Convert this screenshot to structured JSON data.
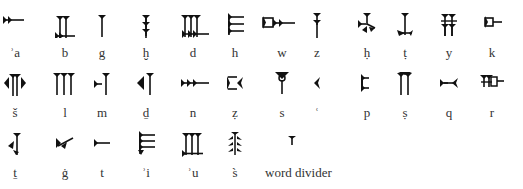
{
  "rows": [
    {
      "signs": [
        {
          "translit": "ʾa",
          "icon": "cuneiform-a-icon"
        },
        {
          "translit": "b",
          "icon": "cuneiform-b-icon"
        },
        {
          "translit": "g",
          "icon": "cuneiform-g-icon"
        },
        {
          "translit": "ḫ",
          "icon": "cuneiform-kh-icon"
        },
        {
          "translit": "d",
          "icon": "cuneiform-d-icon"
        },
        {
          "translit": "h",
          "icon": "cuneiform-h-icon"
        },
        {
          "translit": "w",
          "icon": "cuneiform-w-icon"
        },
        {
          "translit": "z",
          "icon": "cuneiform-z-icon"
        },
        {
          "translit": "ḥ",
          "icon": "cuneiform-hh-icon"
        },
        {
          "translit": "ṭ",
          "icon": "cuneiform-tt-icon"
        },
        {
          "translit": "y",
          "icon": "cuneiform-y-icon"
        },
        {
          "translit": "k",
          "icon": "cuneiform-k-icon"
        }
      ]
    },
    {
      "signs": [
        {
          "translit": "š",
          "icon": "cuneiform-sh-icon"
        },
        {
          "translit": "l",
          "icon": "cuneiform-l-icon"
        },
        {
          "translit": "m",
          "icon": "cuneiform-m-icon"
        },
        {
          "translit": "ḏ",
          "icon": "cuneiform-dh-icon"
        },
        {
          "translit": "n",
          "icon": "cuneiform-n-icon"
        },
        {
          "translit": "ẓ",
          "icon": "cuneiform-zz-icon"
        },
        {
          "translit": "s",
          "icon": "cuneiform-s-icon"
        },
        {
          "translit": "ʿ",
          "icon": "cuneiform-ayin-icon"
        },
        {
          "translit": "p",
          "icon": "cuneiform-p-icon"
        },
        {
          "translit": "ṣ",
          "icon": "cuneiform-ss-icon"
        },
        {
          "translit": "q",
          "icon": "cuneiform-q-icon"
        },
        {
          "translit": "r",
          "icon": "cuneiform-r-icon"
        }
      ]
    },
    {
      "signs": [
        {
          "translit": "ṯ",
          "icon": "cuneiform-th-icon"
        },
        {
          "translit": "ġ",
          "icon": "cuneiform-gh-icon"
        },
        {
          "translit": "t",
          "icon": "cuneiform-t-icon"
        },
        {
          "translit": "ʾi",
          "icon": "cuneiform-i-icon"
        },
        {
          "translit": "ʾu",
          "icon": "cuneiform-u-icon"
        },
        {
          "translit": "s̀",
          "icon": "cuneiform-s2-icon"
        },
        {
          "translit": "word divider",
          "icon": "cuneiform-word-divider-icon"
        }
      ]
    }
  ]
}
